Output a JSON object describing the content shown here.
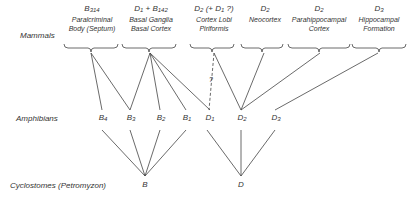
{
  "rows": {
    "mammals": "Mammals",
    "amphibians": "Amphibians",
    "cyclostomes": "Cyclostomes (Petromyzon)"
  },
  "mammal_groups": [
    {
      "code": "B",
      "sub": "314",
      "line1": "Paralcriminal",
      "line2": "Body (Septum)"
    },
    {
      "code": "D",
      "sub": "1",
      "extra": " + B",
      "extra_sub": "142",
      "line1": "Basal Ganglia",
      "line2": "Basal Cortex"
    },
    {
      "code": "D",
      "sub": "2",
      "extra": " (+ D",
      "extra_sub": "1",
      "extra_tail": " ?)",
      "line1": "Cortex Lobi",
      "line2": "Piriformis"
    },
    {
      "code": "D",
      "sub": "2",
      "line1": "Neocortex",
      "line2": ""
    },
    {
      "code": "D",
      "sub": "2",
      "line1": "Parahippocampal",
      "line2": "Cortex"
    },
    {
      "code": "D",
      "sub": "3",
      "line1": "Hippocampal",
      "line2": "Formation"
    }
  ],
  "amphibian_nodes": [
    {
      "code": "B",
      "sub": "4"
    },
    {
      "code": "B",
      "sub": "3"
    },
    {
      "code": "B",
      "sub": "2"
    },
    {
      "code": "B",
      "sub": "1"
    },
    {
      "code": "D",
      "sub": "1"
    },
    {
      "code": "D",
      "sub": "2"
    },
    {
      "code": "D",
      "sub": "3"
    }
  ],
  "cyclostome_nodes": [
    {
      "code": "B"
    },
    {
      "code": "D"
    }
  ],
  "uncertain_mark": "?"
}
